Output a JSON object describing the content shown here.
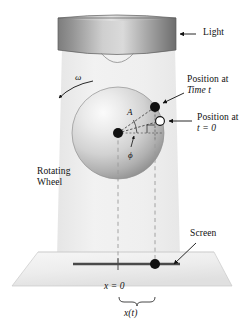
{
  "figure": {
    "labels": {
      "light": "Light",
      "position_time_t_line1": "Position at",
      "position_time_t_line2": "Time t",
      "position_t0_line1": "Position at",
      "position_t0_line2": "t = 0",
      "rotating_line1": "Rotating",
      "rotating_line2": "Wheel",
      "screen": "Screen",
      "x_zero": "x = 0",
      "x_of_t": "x(t)",
      "omega": "ω",
      "phi": "ϕ",
      "amplitude": "A"
    },
    "colors": {
      "ink": "#111111",
      "cylinder_dark": "#6e6e6e",
      "cylinder_light": "#d8d8d8",
      "beam": "#ececec",
      "wheel_light": "#f2f2f2",
      "wheel_dark": "#9a9a9a",
      "screen_fill": "#efefef",
      "axis_bar": "#4a4a4a",
      "dashed": "#8a8a8a"
    },
    "geometry": {
      "wheel_center_x": 118,
      "wheel_center_y": 133,
      "wheel_radius": 46,
      "point_t_x": 155,
      "point_t_y": 107,
      "point_t0_x": 160,
      "point_t0_y": 121,
      "screen_dot_x": 155,
      "screen_dot_y": 264,
      "screen_origin_x": 118,
      "screen_origin_y": 264
    }
  }
}
